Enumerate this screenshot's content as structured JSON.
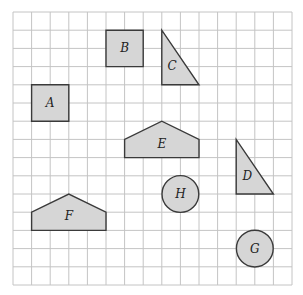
{
  "diagram": {
    "type": "grid-shapes",
    "grid": {
      "cols": 15,
      "rows": 15,
      "origin_x": 13,
      "origin_y": 12,
      "cell_w": 18.6,
      "cell_h": 18.2,
      "line_color": "#c4c4c4"
    },
    "style": {
      "fill": "#d6d6d6",
      "stroke": "#3a3a3a"
    },
    "shapes": [
      {
        "label": "A",
        "kind": "polygon",
        "name": "square-a",
        "points": [
          [
            1,
            4
          ],
          [
            3,
            4
          ],
          [
            3,
            6
          ],
          [
            1,
            6
          ]
        ],
        "label_pos": [
          2,
          5
        ]
      },
      {
        "label": "B",
        "kind": "polygon",
        "name": "square-b",
        "points": [
          [
            5,
            1
          ],
          [
            7,
            1
          ],
          [
            7,
            3
          ],
          [
            5,
            3
          ]
        ],
        "label_pos": [
          6,
          2
        ]
      },
      {
        "label": "C",
        "kind": "polygon",
        "name": "triangle-c",
        "points": [
          [
            8,
            1
          ],
          [
            8,
            4
          ],
          [
            10,
            4
          ]
        ],
        "label_pos": [
          8.55,
          2.95
        ]
      },
      {
        "label": "D",
        "kind": "polygon",
        "name": "triangle-d",
        "points": [
          [
            12,
            7
          ],
          [
            12,
            10
          ],
          [
            14,
            10
          ]
        ],
        "label_pos": [
          12.6,
          9.0
        ]
      },
      {
        "label": "E",
        "kind": "polygon",
        "name": "pentagon-e",
        "points": [
          [
            6,
            8
          ],
          [
            6,
            7
          ],
          [
            8,
            6
          ],
          [
            10,
            7
          ],
          [
            10,
            8
          ]
        ],
        "label_pos": [
          8,
          7.25
        ]
      },
      {
        "label": "F",
        "kind": "polygon",
        "name": "pentagon-f",
        "points": [
          [
            1,
            12
          ],
          [
            1,
            11
          ],
          [
            3,
            10
          ],
          [
            5,
            11
          ],
          [
            5,
            12
          ]
        ],
        "label_pos": [
          3,
          11.2
        ]
      },
      {
        "label": "G",
        "kind": "circle",
        "name": "circle-g",
        "center": [
          13,
          13
        ],
        "radius": 1,
        "label_pos": [
          13,
          13
        ]
      },
      {
        "label": "H",
        "kind": "circle",
        "name": "circle-h",
        "center": [
          9,
          10
        ],
        "radius": 1,
        "label_pos": [
          9,
          10
        ]
      }
    ]
  }
}
